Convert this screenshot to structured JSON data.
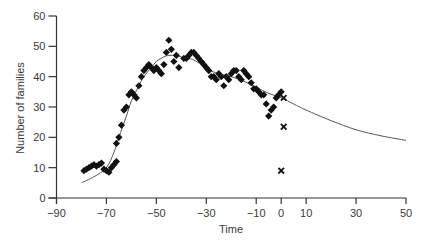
{
  "chart_data": {
    "type": "scatter",
    "title": "",
    "xlabel": "Time",
    "ylabel": "Number of families",
    "xlim": [
      -90,
      50
    ],
    "ylim": [
      0,
      60
    ],
    "x_ticks": [
      -90,
      -70,
      -50,
      -30,
      -10,
      0,
      10,
      30,
      50
    ],
    "y_ticks": [
      0,
      10,
      20,
      30,
      40,
      50,
      60
    ],
    "grid": false,
    "legend": null,
    "series": [
      {
        "name": "observed",
        "marker": "diamond",
        "points": [
          [
            -79,
            9
          ],
          [
            -78,
            9.5
          ],
          [
            -77,
            10
          ],
          [
            -76,
            10.5
          ],
          [
            -75,
            11
          ],
          [
            -74,
            10.5
          ],
          [
            -73,
            11
          ],
          [
            -72,
            11.5
          ],
          [
            -71,
            9.5
          ],
          [
            -70,
            9
          ],
          [
            -69,
            8.5
          ],
          [
            -68,
            10
          ],
          [
            -67,
            11
          ],
          [
            -66,
            12
          ],
          [
            -66,
            18
          ],
          [
            -65,
            20
          ],
          [
            -64,
            24
          ],
          [
            -63,
            29
          ],
          [
            -62,
            30
          ],
          [
            -61,
            34
          ],
          [
            -60,
            35
          ],
          [
            -59,
            34
          ],
          [
            -58,
            33
          ],
          [
            -57,
            37
          ],
          [
            -56,
            40
          ],
          [
            -55,
            42
          ],
          [
            -54,
            43
          ],
          [
            -53,
            44
          ],
          [
            -52,
            43
          ],
          [
            -51,
            42
          ],
          [
            -50,
            43
          ],
          [
            -49,
            42
          ],
          [
            -48,
            41
          ],
          [
            -47,
            44
          ],
          [
            -46,
            48
          ],
          [
            -45,
            52
          ],
          [
            -44,
            49
          ],
          [
            -43,
            45
          ],
          [
            -42,
            47
          ],
          [
            -41,
            43
          ],
          [
            -39,
            46
          ],
          [
            -38,
            46
          ],
          [
            -37,
            47
          ],
          [
            -36,
            48
          ],
          [
            -35,
            48
          ],
          [
            -34,
            47
          ],
          [
            -33,
            46
          ],
          [
            -32,
            45
          ],
          [
            -31,
            44
          ],
          [
            -30,
            43
          ],
          [
            -29,
            42
          ],
          [
            -28,
            40
          ],
          [
            -27,
            40
          ],
          [
            -26,
            39
          ],
          [
            -25,
            41
          ],
          [
            -24,
            40
          ],
          [
            -23,
            37
          ],
          [
            -22,
            40
          ],
          [
            -21,
            39
          ],
          [
            -20,
            41
          ],
          [
            -19,
            42
          ],
          [
            -18,
            42
          ],
          [
            -17,
            40
          ],
          [
            -16,
            39
          ],
          [
            -15,
            42
          ],
          [
            -14,
            41
          ],
          [
            -13,
            40
          ],
          [
            -12,
            38
          ],
          [
            -11,
            36
          ],
          [
            -10,
            36
          ],
          [
            -9,
            35
          ],
          [
            -8,
            34
          ],
          [
            -7,
            34
          ],
          [
            -6,
            31
          ],
          [
            -5,
            27
          ],
          [
            -4,
            29
          ],
          [
            -3,
            30
          ],
          [
            -2,
            33
          ],
          [
            -1,
            34
          ],
          [
            0,
            35
          ]
        ]
      },
      {
        "name": "cross markers",
        "marker": "x",
        "points": [
          [
            1,
            33
          ],
          [
            1,
            23.5
          ],
          [
            0,
            9
          ]
        ]
      },
      {
        "name": "fitted curve",
        "type": "line",
        "points": [
          [
            -80,
            5
          ],
          [
            -75,
            7
          ],
          [
            -70,
            10
          ],
          [
            -67,
            15
          ],
          [
            -65,
            20
          ],
          [
            -62,
            27
          ],
          [
            -60,
            32
          ],
          [
            -57,
            37
          ],
          [
            -55,
            40
          ],
          [
            -52,
            43
          ],
          [
            -50,
            45
          ],
          [
            -47,
            46.5
          ],
          [
            -45,
            47
          ],
          [
            -42,
            47
          ],
          [
            -40,
            46.5
          ],
          [
            -37,
            46
          ],
          [
            -35,
            45.5
          ],
          [
            -32,
            44
          ],
          [
            -30,
            42.5
          ],
          [
            -25,
            41
          ],
          [
            -20,
            40
          ],
          [
            -15,
            38.5
          ],
          [
            -10,
            36.5
          ],
          [
            -5,
            34.5
          ],
          [
            0,
            33
          ],
          [
            5,
            31
          ],
          [
            10,
            29
          ],
          [
            20,
            25.5
          ],
          [
            30,
            22.5
          ],
          [
            40,
            20.5
          ],
          [
            50,
            19
          ]
        ]
      }
    ]
  }
}
